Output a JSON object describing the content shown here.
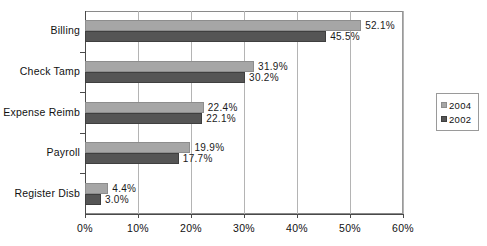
{
  "chart_data": {
    "type": "bar",
    "orientation": "horizontal",
    "title": "",
    "subtitle": "",
    "xlabel": "",
    "ylabel": "",
    "xlim": [
      0,
      60
    ],
    "ylim": null,
    "grid": true,
    "grid_axis": "x",
    "legend_position": "right",
    "categories": [
      "Billing",
      "Check Tamp",
      "Expense Reimb",
      "Payroll",
      "Register Disb"
    ],
    "series": [
      {
        "name": "2004",
        "color": "#a6a6a6",
        "values": [
          52.1,
          31.9,
          22.4,
          19.9,
          4.4
        ],
        "labels": [
          "52.1%",
          "31.9%",
          "22.4%",
          "19.9%",
          "4.4%"
        ]
      },
      {
        "name": "2002",
        "color": "#555555",
        "values": [
          45.5,
          30.2,
          22.1,
          17.7,
          3.0
        ],
        "labels": [
          "45.5%",
          "30.2%",
          "22.1%",
          "17.7%",
          "3.0%"
        ]
      }
    ],
    "xticks": [
      0,
      10,
      20,
      30,
      40,
      50,
      60
    ],
    "xtick_labels": [
      "0%",
      "10%",
      "20%",
      "30%",
      "40%",
      "50%",
      "60%"
    ]
  },
  "legend": {
    "items": [
      {
        "label": "2004",
        "color": "#a6a6a6"
      },
      {
        "label": "2002",
        "color": "#555555"
      }
    ]
  }
}
